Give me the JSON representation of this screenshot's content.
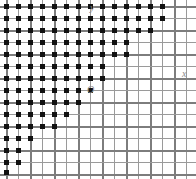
{
  "figure": {
    "name": "lattice-point-region-diagram",
    "width": 196,
    "height": 179,
    "background_color": "#ffffff"
  },
  "grid": {
    "cell_size": 12,
    "columns": 16,
    "rows": 15,
    "origin_x_px": 90,
    "origin_y_px": 90,
    "minor_color": "#9a9a9a",
    "major_color": "#7d7d7d",
    "major_every": 2
  },
  "labels": {
    "y_axis": "y",
    "x_axis": "x",
    "origin": "O",
    "color": "#8e8e8e"
  },
  "chart_data": {
    "type": "scatter",
    "title": "",
    "xlabel": "x",
    "ylabel": "y",
    "marker": "filled-square",
    "marker_color": "#111111",
    "marker_size_px": 5,
    "grid": true,
    "legend": null,
    "axis_origin_node": [
      7,
      7
    ],
    "row_extents_note": "Each entry gives the pixel y of the lattice row and the list of pixel x positions carrying a dot.",
    "rows": [
      {
        "y": 6,
        "x": [
          6,
          18,
          30,
          42,
          54,
          66,
          78,
          90,
          102,
          114,
          126,
          138,
          150,
          162
        ]
      },
      {
        "y": 18,
        "x": [
          6,
          18,
          30,
          42,
          54,
          66,
          78,
          90,
          102,
          114,
          126,
          138,
          150,
          162
        ]
      },
      {
        "y": 30,
        "x": [
          6,
          18,
          30,
          42,
          54,
          66,
          78,
          90,
          102,
          114,
          126,
          138,
          150
        ]
      },
      {
        "y": 42,
        "x": [
          6,
          18,
          30,
          42,
          54,
          66,
          78,
          90,
          102,
          114,
          126
        ]
      },
      {
        "y": 54,
        "x": [
          6,
          18,
          30,
          42,
          54,
          66,
          78,
          90,
          102,
          114,
          126
        ]
      },
      {
        "y": 66,
        "x": [
          6,
          18,
          30,
          42,
          54,
          66,
          78,
          90,
          102
        ]
      },
      {
        "y": 78,
        "x": [
          6,
          18,
          30,
          42,
          54,
          66,
          78,
          90,
          102
        ]
      },
      {
        "y": 90,
        "x": [
          6,
          18,
          30,
          42,
          54,
          66,
          78,
          90
        ]
      },
      {
        "y": 102,
        "x": [
          6,
          18,
          30,
          42,
          54,
          66,
          78
        ]
      },
      {
        "y": 114,
        "x": [
          6,
          18,
          30,
          42,
          54,
          66
        ]
      },
      {
        "y": 126,
        "x": [
          6,
          18,
          30,
          42,
          54
        ]
      },
      {
        "y": 138,
        "x": [
          6,
          18,
          30
        ]
      },
      {
        "y": 150,
        "x": [
          6,
          18
        ]
      },
      {
        "y": 162,
        "x": [
          6,
          18
        ]
      },
      {
        "y": 172,
        "x": [
          6
        ]
      }
    ]
  }
}
